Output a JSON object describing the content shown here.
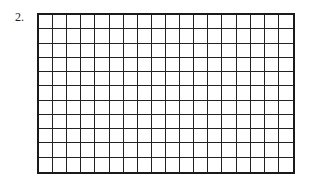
{
  "problem": {
    "number_label": "2.",
    "grid": {
      "rows": 11,
      "columns": 18,
      "line_color": "#1a1a1a"
    }
  }
}
